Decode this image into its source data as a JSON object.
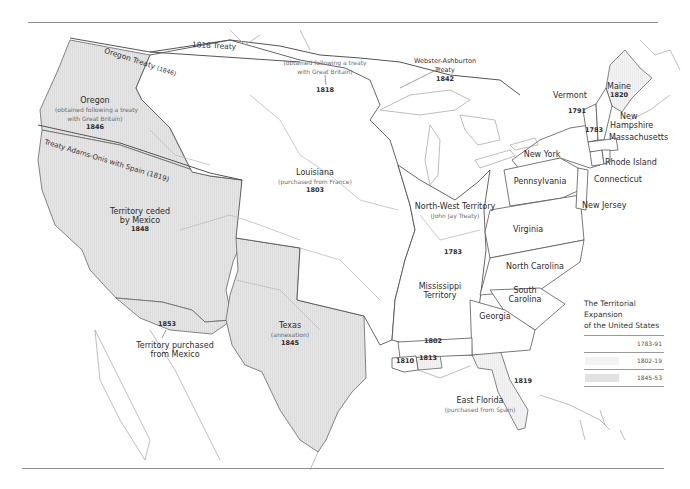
{
  "map": {
    "title": "The Territorial Expansion of the United States",
    "title_line1": "The Territorial Expansion",
    "title_line2": "of the United States",
    "colors": {
      "period_1783_91": "#ffffff",
      "period_1802_19": "#f4f4f4",
      "period_1845_53": "#e4e4e4",
      "border": "#555555",
      "river": "#b8b8b8",
      "coast": "#999999"
    },
    "legend": [
      {
        "range": "1783-91",
        "color": "#ffffff"
      },
      {
        "range": "1802-19",
        "color": "#f2f2f2"
      },
      {
        "range": "1845-53",
        "color": "#e2e2e2"
      }
    ],
    "boundary_labels": {
      "treaty_1818": "1818 Treaty",
      "oregon_treaty": "Oregon Treaty",
      "oregon_treaty_year": "(1846)",
      "adams_onis": "Treaty Adams-Onis with Spain (1819)"
    },
    "regions": {
      "oregon": {
        "name": "Oregon",
        "sub1": "(obtained following a treaty",
        "sub2": "with Great Britain)",
        "year": "1846"
      },
      "red_river": {
        "sub1": "(obtained following a treaty",
        "sub2": "with Great Britain)",
        "year": "1818"
      },
      "webster": {
        "name1": "Webster-Ashburton",
        "name2": "Treaty",
        "year": "1842"
      },
      "louisiana": {
        "name": "Louisiana",
        "sub": "(purchased from France)",
        "year": "1803"
      },
      "mexico_cession": {
        "name1": "Territory ceded",
        "name2": "by Mexico",
        "year": "1848"
      },
      "gadsden": {
        "year": "1853",
        "name1": "Territory purchased",
        "name2": "from Mexico"
      },
      "texas": {
        "name": "Texas",
        "sub": "(annexation)",
        "year": "1845"
      },
      "northwest": {
        "name": "North-West Territory",
        "sub": "(John Jay Treaty)"
      },
      "year_1783": "1783",
      "mississippi": {
        "name1": "Mississippi",
        "name2": "Territory"
      },
      "year_1802": "1802",
      "year_1810": "1810",
      "year_1813": "1813",
      "east_florida": {
        "year": "1819",
        "name": "East Florida",
        "sub": "(purchased from Spain)"
      }
    },
    "states": {
      "maine": {
        "name": "Maine",
        "year": "1820"
      },
      "vermont": {
        "name": "Vermont",
        "year": "1791"
      },
      "new_hampshire": {
        "name1": "New",
        "name2": "Hampshire",
        "year": "1783"
      },
      "massachusetts": "Massachusetts",
      "new_york": "New York",
      "rhode_island": "Rhode Island",
      "connecticut": "Connecticut",
      "pennsylvania": "Pennsylvania",
      "new_jersey": "New Jersey",
      "virginia": "Virginia",
      "north_carolina": "North Carolina",
      "south_carolina": {
        "name1": "South",
        "name2": "Carolina"
      },
      "georgia": "Georgia"
    }
  }
}
